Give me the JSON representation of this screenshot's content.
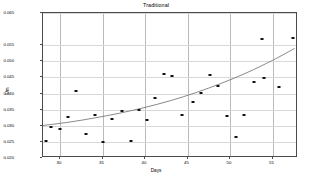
{
  "chart_data": {
    "type": "scatter",
    "title": "Traditional",
    "xlabel": "Days",
    "ylabel": "Um",
    "xlim": [
      28,
      58
    ],
    "ylim": [
      0.02,
      0.065
    ],
    "grid": true,
    "legend": null,
    "xticks": [
      "30",
      "35",
      "40",
      "45",
      "50",
      "55"
    ],
    "xtick_values": [
      30,
      35,
      40,
      45,
      50,
      55
    ],
    "yticks": [
      "0.065",
      "0.055",
      "0.050",
      "0.045",
      "0.040",
      "0.035",
      "0.030",
      "0.025",
      "0.020"
    ],
    "ytick_values": [
      0.065,
      0.055,
      0.05,
      0.045,
      0.04,
      0.035,
      0.03,
      0.025,
      0.02
    ],
    "series": [
      {
        "name": "observations",
        "marker": "square",
        "color": "#111111",
        "points": [
          {
            "x": 28.3,
            "y": 0.0252
          },
          {
            "x": 28.9,
            "y": 0.0295
          },
          {
            "x": 30.0,
            "y": 0.029
          },
          {
            "x": 30.9,
            "y": 0.0327
          },
          {
            "x": 31.9,
            "y": 0.0409
          },
          {
            "x": 33.0,
            "y": 0.0276
          },
          {
            "x": 34.1,
            "y": 0.0334
          },
          {
            "x": 35.1,
            "y": 0.025
          },
          {
            "x": 36.1,
            "y": 0.0321
          },
          {
            "x": 37.3,
            "y": 0.0347
          },
          {
            "x": 38.4,
            "y": 0.0252
          },
          {
            "x": 39.3,
            "y": 0.0348
          },
          {
            "x": 40.2,
            "y": 0.0317
          },
          {
            "x": 41.2,
            "y": 0.0385
          },
          {
            "x": 42.2,
            "y": 0.0462
          },
          {
            "x": 43.2,
            "y": 0.0456
          },
          {
            "x": 44.3,
            "y": 0.0335
          },
          {
            "x": 45.6,
            "y": 0.0374
          },
          {
            "x": 46.6,
            "y": 0.0403
          },
          {
            "x": 47.6,
            "y": 0.0458
          },
          {
            "x": 48.6,
            "y": 0.0424
          },
          {
            "x": 49.7,
            "y": 0.0329
          },
          {
            "x": 50.7,
            "y": 0.0266
          },
          {
            "x": 51.7,
            "y": 0.0335
          },
          {
            "x": 52.8,
            "y": 0.0437
          },
          {
            "x": 53.8,
            "y": 0.057
          },
          {
            "x": 54.0,
            "y": 0.0448
          },
          {
            "x": 55.8,
            "y": 0.0421
          },
          {
            "x": 57.4,
            "y": 0.0572
          }
        ]
      }
    ],
    "fit_line": {
      "name": "fitted-curve",
      "color": "#6b6b6b",
      "points": [
        {
          "x": 28.0,
          "y": 0.0301
        },
        {
          "x": 31.0,
          "y": 0.0311
        },
        {
          "x": 34.0,
          "y": 0.0324
        },
        {
          "x": 37.0,
          "y": 0.0339
        },
        {
          "x": 40.0,
          "y": 0.0357
        },
        {
          "x": 43.0,
          "y": 0.0378
        },
        {
          "x": 46.0,
          "y": 0.0403
        },
        {
          "x": 49.0,
          "y": 0.0432
        },
        {
          "x": 52.0,
          "y": 0.0465
        },
        {
          "x": 55.0,
          "y": 0.0503
        },
        {
          "x": 57.6,
          "y": 0.054
        }
      ]
    }
  }
}
